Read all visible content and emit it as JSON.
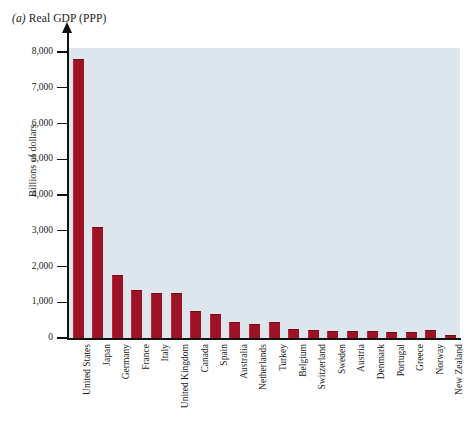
{
  "chart_data": {
    "type": "bar",
    "title": "(a) Real GDP (PPP)",
    "panel_label": "(a)",
    "title_text": "Real GDP (PPP)",
    "xlabel": "",
    "ylabel": "Billions of dollars",
    "ylim": [
      0,
      8000
    ],
    "ytick_labels": [
      "8,000",
      "7,000",
      "6,000",
      "5,000",
      "4,000",
      "3,000",
      "2,000",
      "1,000",
      "0"
    ],
    "ytick_values": [
      8000,
      7000,
      6000,
      5000,
      4000,
      3000,
      2000,
      1000,
      0
    ],
    "grid": false,
    "legend": null,
    "bar_color": "#9e1225",
    "plot_background": "#dde5ed",
    "categories": [
      "United States",
      "Japan",
      "Germany",
      "France",
      "Italy",
      "United Kingdom",
      "Canada",
      "Spain",
      "Australia",
      "Netherlands",
      "Turkey",
      "Belgium",
      "Switzerland",
      "Sweden",
      "Austria",
      "Denmark",
      "Portugal",
      "Greece",
      "Norway",
      "New Zealand"
    ],
    "values": [
      7800,
      3100,
      1750,
      1330,
      1250,
      1250,
      750,
      680,
      450,
      400,
      460,
      250,
      210,
      200,
      200,
      190,
      170,
      170,
      210,
      75
    ]
  }
}
